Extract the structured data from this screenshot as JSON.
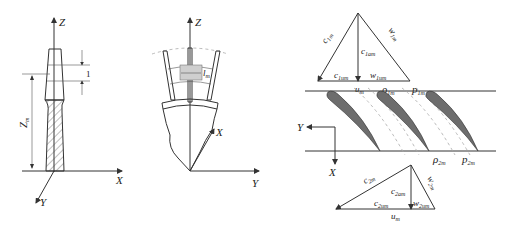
{
  "figure_a": {
    "axes": {
      "z": "Z",
      "x": "X",
      "y": "Y"
    },
    "dimension_label": "1",
    "height_label": {
      "main": "Z",
      "sub": "m"
    }
  },
  "figure_b": {
    "axes": {
      "z": "Z",
      "x": "X",
      "y": "Y"
    },
    "width_label": {
      "main": "l",
      "sub": "m"
    }
  },
  "figure_c": {
    "axes": {
      "y": "Y",
      "x": "X"
    },
    "inlet_triangle": {
      "c_abs": {
        "main": "c",
        "sub": "1m"
      },
      "w_rel": {
        "main": "w",
        "sub": "1m"
      },
      "c_axial": {
        "main": "c",
        "sub": "1am"
      },
      "c_u": {
        "main": "c",
        "sub": "1um"
      },
      "w_u": {
        "main": "w",
        "sub": "1um"
      },
      "u": {
        "main": "u",
        "sub": "m"
      }
    },
    "inlet_labels": {
      "rho": {
        "main": "ρ",
        "sub": "1m"
      },
      "p": {
        "main": "p",
        "sub": "1m"
      }
    },
    "outlet_labels": {
      "rho": {
        "main": "ρ",
        "sub": "2m"
      },
      "p": {
        "main": "p",
        "sub": "2m"
      }
    },
    "outlet_triangle": {
      "c_abs": {
        "main": "c",
        "sub": "2m"
      },
      "w_rel": {
        "main": "w",
        "sub": "2m"
      },
      "c_axial": {
        "main": "c",
        "sub": "2am"
      },
      "c_u": {
        "main": "c",
        "sub": "2um"
      },
      "w_u": {
        "main": "w",
        "sub": "2um"
      },
      "u": {
        "main": "u",
        "sub": "m"
      }
    }
  }
}
